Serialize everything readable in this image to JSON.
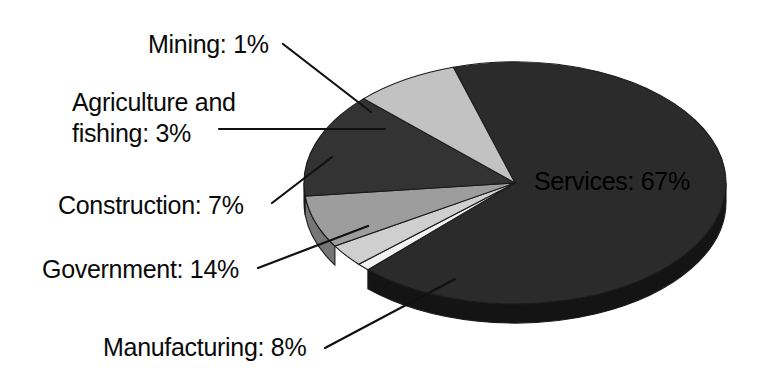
{
  "chart_data": {
    "type": "pie",
    "title": "",
    "subtitle": "",
    "xlabel": "",
    "ylabel": "",
    "legend_position": "none",
    "grid": false,
    "units": "percent",
    "categories": [
      "Services",
      "Mining",
      "Agriculture and fishing",
      "Construction",
      "Government",
      "Manufacturing"
    ],
    "values": [
      67,
      1,
      3,
      7,
      14,
      8
    ],
    "labels": [
      "Services: 67%",
      "Mining: 1%",
      "Agriculture and fishing: 3%",
      "Construction: 7%",
      "Government: 14%",
      "Manufacturing: 8%"
    ],
    "slices": [
      {
        "name": "Services",
        "value": 67,
        "label": "Services: 67%",
        "color": "#2b2b2b",
        "side_color": "#141414",
        "label_placement": "inside"
      },
      {
        "name": "Mining",
        "value": 1,
        "label": "Mining: 1%",
        "color": "#f2f2f2",
        "side_color": "#b8b8b8",
        "label_placement": "outside"
      },
      {
        "name": "Agriculture and fishing",
        "value": 3,
        "label": "Agriculture and fishing: 3%",
        "color": "#cfcfcf",
        "side_color": "#9c9c9c",
        "label_placement": "outside"
      },
      {
        "name": "Construction",
        "value": 7,
        "label": "Construction: 7%",
        "color": "#9d9d9d",
        "side_color": "#767676",
        "label_placement": "outside"
      },
      {
        "name": "Government",
        "value": 14,
        "label": "Government: 14%",
        "color": "#333333",
        "side_color": "#1b1b1b",
        "label_placement": "outside"
      },
      {
        "name": "Manufacturing",
        "value": 8,
        "label": "Manufacturing: 8%",
        "color": "#c2c2c2",
        "side_color": "#8f8f8f",
        "label_placement": "outside"
      }
    ]
  },
  "labels": {
    "mining": "Mining: 1%",
    "agriculture_line1": "Agriculture and",
    "agriculture_line2": "fishing: 3%",
    "construction": "Construction: 7%",
    "government": "Government: 14%",
    "manufacturing": "Manufacturing: 8%",
    "services": "Services: 67%"
  },
  "colors": {
    "background": "#ffffff",
    "text": "#0a0a0a",
    "leader_line": "#111111",
    "services": "#2b2b2b",
    "mining": "#f2f2f2",
    "agriculture": "#cfcfcf",
    "construction": "#9d9d9d",
    "government": "#333333",
    "manufacturing": "#c2c2c2"
  }
}
